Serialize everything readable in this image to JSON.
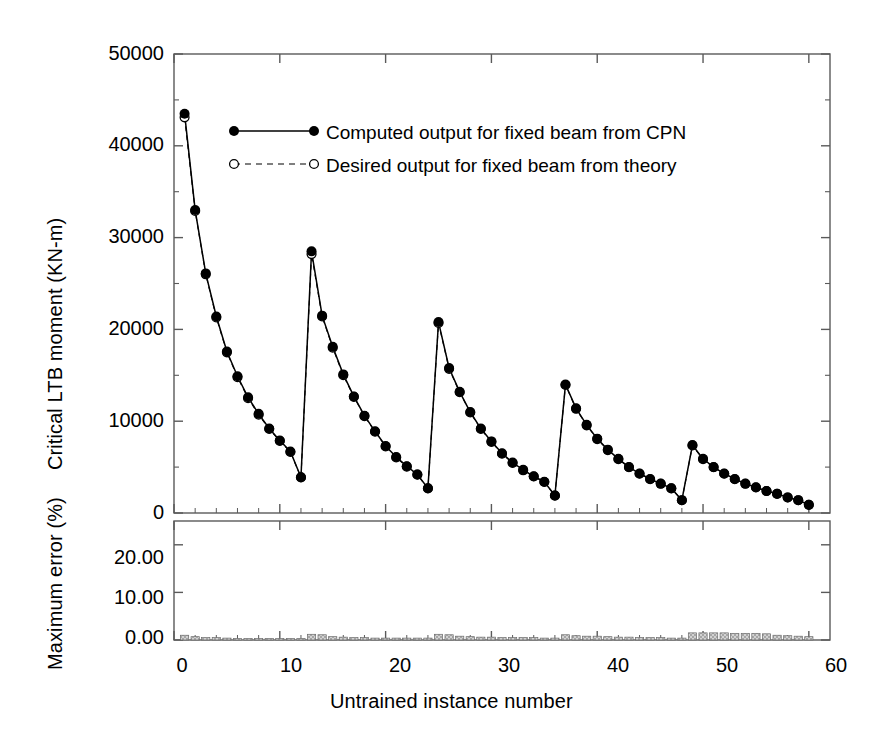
{
  "figure": {
    "background": "#ffffff",
    "axis_color": "#5a5a5a",
    "series_color": "#000000",
    "error_bar_fill": "#c9c9c9",
    "error_bar_edge": "#555555"
  },
  "chart_data": {
    "type": "line",
    "title": "",
    "xlabel": "Untrained instance number",
    "xlim": [
      0,
      62
    ],
    "xticks": [
      0,
      10,
      20,
      30,
      40,
      50,
      60
    ],
    "xtick_labels": [
      "0",
      "10",
      "20",
      "30",
      "40",
      "50",
      "60"
    ],
    "grid": false,
    "legend_position": "upper center",
    "panels": [
      {
        "name": "critical-ltb-moment-panel",
        "ylabel": "Critical LTB moment (KN-m)",
        "ylim": [
          0,
          50000
        ],
        "yticks": [
          0,
          10000,
          20000,
          30000,
          40000,
          50000
        ],
        "ytick_labels": [
          "0",
          "10000",
          "20000",
          "30000",
          "40000",
          "50000"
        ],
        "minor_yticks": [
          5000,
          15000,
          25000,
          35000,
          45000
        ],
        "x": [
          1,
          2,
          3,
          4,
          5,
          6,
          7,
          8,
          9,
          10,
          11,
          12,
          13,
          14,
          15,
          16,
          17,
          18,
          19,
          20,
          21,
          22,
          23,
          24,
          25,
          26,
          27,
          28,
          29,
          30,
          31,
          32,
          33,
          34,
          35,
          36,
          37,
          38,
          39,
          40,
          41,
          42,
          43,
          44,
          45,
          46,
          47,
          48,
          49,
          50,
          51,
          52,
          53,
          54,
          55,
          56,
          57,
          58,
          59,
          60
        ],
        "series": [
          {
            "name": "Computed output for fixed beam from CPN",
            "marker": "filled-circle",
            "linestyle": "solid",
            "values": [
              43500,
              33000,
              26100,
              21400,
              17600,
              14900,
              12600,
              10800,
              9200,
              7900,
              6700,
              3900,
              28500,
              21500,
              18100,
              15100,
              12700,
              10600,
              8900,
              7300,
              6100,
              5100,
              4200,
              2700,
              20800,
              15800,
              13200,
              11000,
              9200,
              7800,
              6500,
              5500,
              4700,
              4000,
              3400,
              1900,
              14000,
              11400,
              9600,
              8100,
              6900,
              5900,
              5000,
              4300,
              3700,
              3200,
              2700,
              1400,
              7400,
              5900,
              5000,
              4300,
              3700,
              3200,
              2800,
              2400,
              2100,
              1700,
              1400,
              900
            ]
          },
          {
            "name": "Desired output for fixed beam from theory",
            "marker": "open-circle",
            "linestyle": "dashed",
            "values": [
              43100,
              32900,
              26000,
              21300,
              17500,
              14800,
              12500,
              10700,
              9150,
              7850,
              6650,
              3880,
              28200,
              21400,
              18000,
              15000,
              12650,
              10550,
              8850,
              7250,
              6050,
              5050,
              4180,
              2680,
              20700,
              15700,
              13150,
              10950,
              9150,
              7750,
              6450,
              5450,
              4650,
              3980,
              3380,
              1890,
              13950,
              11350,
              9550,
              8050,
              6850,
              5850,
              4980,
              4280,
              3680,
              3180,
              2680,
              1390,
              7350,
              5850,
              4980,
              4280,
              3680,
              3180,
              2780,
              2390,
              2080,
              1690,
              1390,
              890
            ]
          }
        ]
      },
      {
        "name": "maximum-error-panel",
        "ylabel": "Maximum error (%)",
        "ylim": [
          0,
          25
        ],
        "yticks": [
          0,
          10,
          20
        ],
        "ytick_labels": [
          "0.00",
          "10.00",
          "20.00"
        ],
        "type": "bar",
        "series": [
          {
            "name": "Maximum error (%)",
            "values": [
              1.0,
              0.7,
              0.5,
              0.5,
              0.4,
              0.3,
              0.3,
              0.3,
              0.3,
              0.3,
              0.3,
              0.3,
              1.2,
              1.1,
              0.7,
              0.6,
              0.5,
              0.5,
              0.4,
              0.4,
              0.4,
              0.4,
              0.4,
              0.4,
              1.2,
              1.1,
              0.8,
              0.7,
              0.6,
              0.6,
              0.5,
              0.5,
              0.5,
              0.5,
              0.4,
              0.4,
              1.1,
              0.9,
              0.8,
              0.8,
              0.7,
              0.6,
              0.6,
              0.5,
              0.5,
              0.5,
              0.4,
              0.4,
              1.5,
              1.5,
              1.5,
              1.5,
              1.4,
              1.4,
              1.4,
              1.3,
              1.0,
              0.9,
              0.8,
              0.7
            ]
          }
        ]
      }
    ],
    "legend": [
      {
        "label": "Computed output for fixed beam from CPN",
        "marker": "filled-circle",
        "linestyle": "solid"
      },
      {
        "label": "Desired output for fixed beam from theory",
        "marker": "open-circle",
        "linestyle": "dashed"
      }
    ]
  }
}
